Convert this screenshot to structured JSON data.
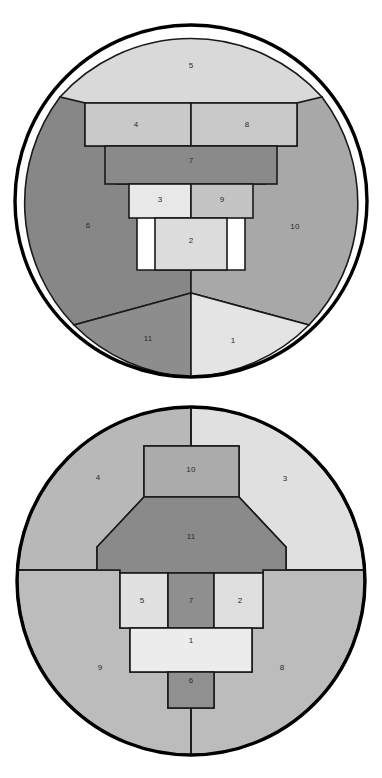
{
  "page": {
    "background_color": "#ffffff",
    "width": 382,
    "height": 778
  },
  "palette": {
    "outline": "#000000",
    "cell_stroke": "#1a1a1a",
    "label_color": "#2b2b2b",
    "tone_lightest": "#ececec",
    "tone_lighter": "#e4e4e4",
    "tone_light": "#d9d9d9",
    "tone_mid_light": "#c9c9c9",
    "tone_mid": "#b4b4b4",
    "tone_mid_dark": "#a8a8a8",
    "tone_dark": "#8d8d8d",
    "tone_darker": "#878787",
    "tone_darkest": "#7e7e7e"
  },
  "figures": [
    {
      "id": "figure-top",
      "name": "circular-partition-top",
      "circle": {
        "cx": 191,
        "cy": 201,
        "r": 176
      },
      "cells": [
        {
          "id": "t5",
          "label": "5",
          "color": "#d9d9d9",
          "label_x": 191,
          "label_y": 66
        },
        {
          "id": "t6",
          "label": "6",
          "color": "#878787",
          "label_x": 88,
          "label_y": 226
        },
        {
          "id": "t10",
          "label": "10",
          "color": "#a8a8a8",
          "label_x": 295,
          "label_y": 227
        },
        {
          "id": "t11",
          "label": "11",
          "color": "#8d8d8d",
          "label_x": 148,
          "label_y": 339
        },
        {
          "id": "t1",
          "label": "1",
          "color": "#e4e4e4",
          "label_x": 233,
          "label_y": 341
        },
        {
          "id": "t4",
          "label": "4",
          "color": "#c9c9c9",
          "label_x": 136,
          "label_y": 125
        },
        {
          "id": "t8",
          "label": "8",
          "color": "#c9c9c9",
          "label_x": 247,
          "label_y": 125
        },
        {
          "id": "t7",
          "label": "7",
          "color": "#8a8a8a",
          "label_x": 191,
          "label_y": 161
        },
        {
          "id": "t3",
          "label": "3",
          "color": "#e8e8e8",
          "label_x": 160,
          "label_y": 200
        },
        {
          "id": "t9",
          "label": "9",
          "color": "#c4c4c4",
          "label_x": 222,
          "label_y": 200
        },
        {
          "id": "t2",
          "label": "2",
          "color": "#dcdcdc",
          "label_x": 191,
          "label_y": 241
        }
      ]
    },
    {
      "id": "figure-bottom",
      "name": "circular-partition-bottom",
      "circle": {
        "cx": 191,
        "cy": 581,
        "r": 174
      },
      "cells": [
        {
          "id": "b4",
          "label": "4",
          "color": "#b8b8b8",
          "label_x": 98,
          "label_y": 478
        },
        {
          "id": "b3",
          "label": "3",
          "color": "#e0e0e0",
          "label_x": 285,
          "label_y": 479
        },
        {
          "id": "b9",
          "label": "9",
          "color": "#bcbcbc",
          "label_x": 100,
          "label_y": 668
        },
        {
          "id": "b8",
          "label": "8",
          "color": "#bcbcbc",
          "label_x": 282,
          "label_y": 668
        },
        {
          "id": "b10",
          "label": "10",
          "color": "#ababab",
          "label_x": 191,
          "label_y": 470
        },
        {
          "id": "b11",
          "label": "11",
          "color": "#8a8a8a",
          "label_x": 191,
          "label_y": 537
        },
        {
          "id": "b5",
          "label": "5",
          "color": "#e1e1e1",
          "label_x": 142,
          "label_y": 601
        },
        {
          "id": "b7",
          "label": "7",
          "color": "#8f8f8f",
          "label_x": 191,
          "label_y": 601
        },
        {
          "id": "b2",
          "label": "2",
          "color": "#dfdfdf",
          "label_x": 240,
          "label_y": 601
        },
        {
          "id": "b1",
          "label": "1",
          "color": "#ececec",
          "label_x": 191,
          "label_y": 641
        },
        {
          "id": "b6",
          "label": "6",
          "color": "#909090",
          "label_x": 191,
          "label_y": 681
        }
      ]
    }
  ]
}
